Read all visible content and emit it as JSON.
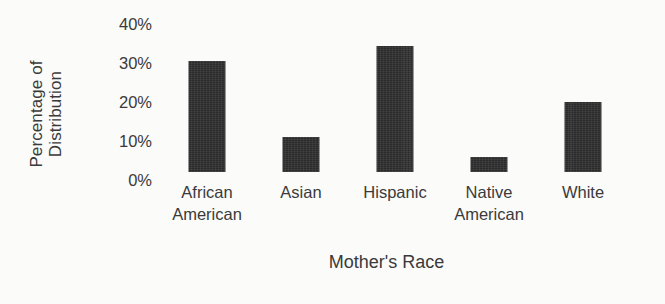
{
  "chart_data": {
    "type": "bar",
    "title": "",
    "xlabel": "Mother's Race",
    "ylabel": "Percentage of Distribution",
    "ylabel_lines": [
      "Percentage of",
      "Distribution"
    ],
    "categories": [
      "African American",
      "Asian",
      "Hispanic",
      "Native American",
      "White"
    ],
    "category_lines": [
      [
        "African",
        "American"
      ],
      [
        "Asian"
      ],
      [
        "Hispanic"
      ],
      [
        "Native",
        "American"
      ],
      [
        "White"
      ]
    ],
    "values": [
      30,
      9.5,
      34,
      4,
      19
    ],
    "value_labels": [
      "30%",
      "9.5%",
      "34%",
      "4%",
      "19%"
    ],
    "ylim": [
      0,
      40
    ],
    "ytick_values": [
      40,
      30,
      20,
      10,
      0
    ],
    "ytick_labels": [
      "40%",
      "30%",
      "20%",
      "10%",
      "0%"
    ],
    "grid": false,
    "legend": false,
    "axis_lines": false,
    "bar_color": "#2b2b2b",
    "background_color": "#fbfbfa",
    "text_color": "#3a3a3a"
  }
}
